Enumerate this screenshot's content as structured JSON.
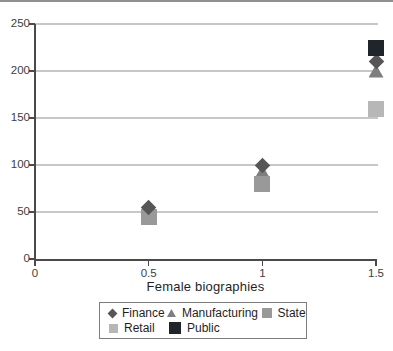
{
  "page": {
    "top_border_color": "#8f8f8f"
  },
  "chart_data": {
    "type": "scatter",
    "title": "",
    "xlabel": "Female biographies",
    "ylabel": "",
    "xlim": [
      0,
      1.5
    ],
    "ylim": [
      0,
      250
    ],
    "x_ticks": [
      "0",
      "0.5",
      "1",
      "1.5"
    ],
    "x_tick_values": [
      0,
      0.5,
      1,
      1.5
    ],
    "y_ticks": [
      "0",
      "50",
      "100",
      "150",
      "200",
      "250"
    ],
    "y_tick_values": [
      0,
      50,
      100,
      150,
      200,
      250
    ],
    "grid": true,
    "grid_color": "#c7c7c7",
    "axis_color": "#4a4a4a",
    "legend_position": "bottom",
    "series": [
      {
        "name": "Finance",
        "marker": "diamond",
        "color": "#565656",
        "points": [
          {
            "x": 0.5,
            "y": 55
          },
          {
            "x": 1,
            "y": 100
          },
          {
            "x": 1.5,
            "y": 210
          }
        ]
      },
      {
        "name": "Manufacturing",
        "marker": "triangle",
        "color": "#7e7e7e",
        "points": [
          {
            "x": 0.5,
            "y": 50
          },
          {
            "x": 1,
            "y": 93
          },
          {
            "x": 1.5,
            "y": 200
          }
        ]
      },
      {
        "name": "State",
        "marker": "square",
        "color": "#999999",
        "points": [
          {
            "x": 0.5,
            "y": 45
          },
          {
            "x": 1,
            "y": 80
          }
        ]
      },
      {
        "name": "Retail",
        "marker": "square",
        "color": "#b7b7b7",
        "points": [
          {
            "x": 1.5,
            "y": 160
          }
        ]
      },
      {
        "name": "Public",
        "marker": "square",
        "color": "#20242b",
        "points": [
          {
            "x": 1.5,
            "y": 225
          }
        ]
      }
    ],
    "legend_rows": [
      [
        "Finance",
        "Manufacturing",
        "State"
      ],
      [
        "Retail",
        "Public"
      ]
    ]
  }
}
